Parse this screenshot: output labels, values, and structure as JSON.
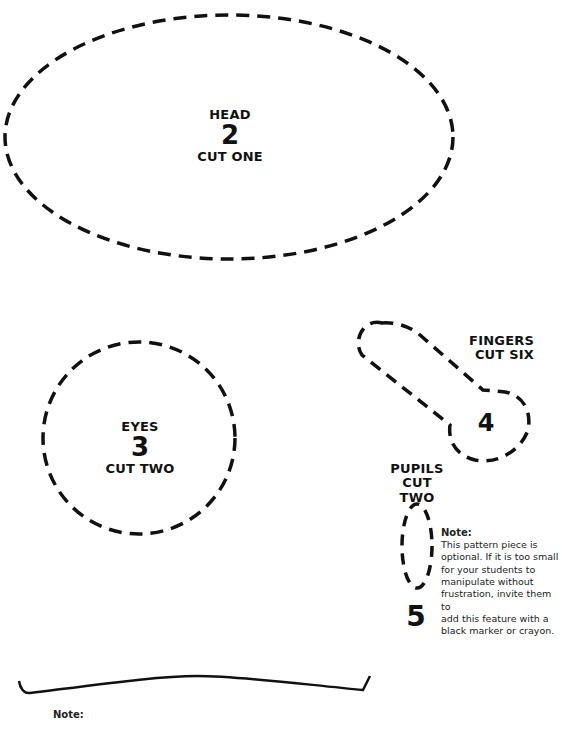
{
  "pieces": {
    "head": {
      "name": "HEAD",
      "number": "2",
      "cut": "CUT ONE"
    },
    "eyes": {
      "name": "EYES",
      "number": "3",
      "cut": "CUT TWO"
    },
    "fingers": {
      "name": "FINGERS",
      "number": "4",
      "cut": "CUT SIX"
    },
    "pupils": {
      "name": "PUPILS",
      "cut_line1": "CUT",
      "cut_line2": "TWO",
      "number": "5"
    }
  },
  "pupils_note": {
    "heading": "Note:",
    "lines": [
      "This pattern piece is",
      "optional.  If it is too small",
      "for your students to",
      "manipulate without",
      "frustration, invite them to",
      "add this feature with a",
      "black marker or crayon."
    ]
  },
  "bottom_note": {
    "heading": "Note:"
  },
  "colors": {
    "ink": "#111111",
    "paper": "#ffffff"
  }
}
